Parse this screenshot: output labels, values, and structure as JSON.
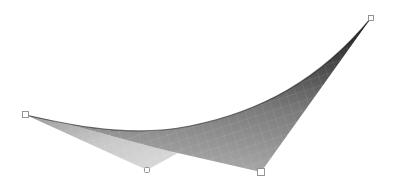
{
  "scene": {
    "type": "bilinear-surface-patch",
    "background": "#ffffff",
    "surface": {
      "shade_dark": "#2a2a2a",
      "shade_mid": "#7a7a7a",
      "shade_light": "#d4d4d4",
      "grid_color": "#9a9a9a"
    },
    "control_points": [
      {
        "id": "p00",
        "x": 26,
        "y": 115
      },
      {
        "id": "p01",
        "x": 371,
        "y": 18
      },
      {
        "id": "p10",
        "x": 147,
        "y": 170
      },
      {
        "id": "p11",
        "x": 261,
        "y": 172
      }
    ]
  }
}
